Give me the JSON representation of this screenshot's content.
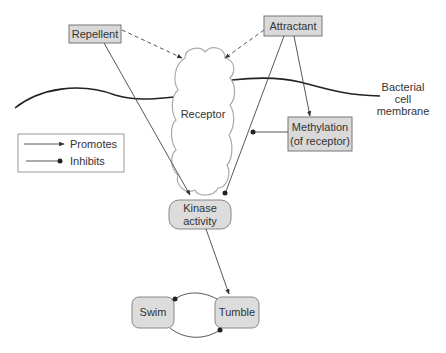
{
  "diagram": {
    "nodes": {
      "repellent": "Repellent",
      "attractant": "Attractant",
      "receptor": "Receptor",
      "methylation_line1": "Methylation",
      "methylation_line2": "(of receptor)",
      "kinase_line1": "Kinase",
      "kinase_line2": "activity",
      "swim": "Swim",
      "tumble": "Tumble"
    },
    "membrane_label": {
      "line1": "Bacterial",
      "line2": "cell",
      "line3": "membrane"
    },
    "legend": {
      "promotes": "Promotes",
      "inhibits": "Inhibits"
    },
    "edges": [
      {
        "from": "Repellent",
        "to": "Receptor",
        "type": "binds (dashed)"
      },
      {
        "from": "Attractant",
        "to": "Receptor",
        "type": "binds (dashed)"
      },
      {
        "from": "Repellent",
        "to": "Kinase activity",
        "type": "promotes"
      },
      {
        "from": "Attractant",
        "to": "Kinase activity",
        "type": "inhibits"
      },
      {
        "from": "Attractant",
        "to": "Methylation",
        "type": "promotes"
      },
      {
        "from": "Methylation",
        "to": "Receptor",
        "type": "inhibits"
      },
      {
        "from": "Kinase activity",
        "to": "Tumble",
        "type": "promotes"
      },
      {
        "from": "Swim",
        "to": "Tumble",
        "type": "mutual inhibition"
      }
    ]
  }
}
